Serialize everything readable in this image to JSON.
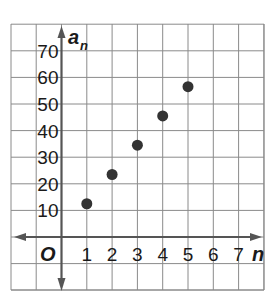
{
  "chart_data": {
    "type": "scatter",
    "title": "",
    "xlabel": "n",
    "ylabel": "a_n",
    "origin_label": "O",
    "x_ticks": [
      1,
      2,
      3,
      4,
      5,
      6,
      7
    ],
    "y_ticks": [
      10,
      20,
      30,
      40,
      50,
      60,
      70
    ],
    "xlim": [
      -2,
      8
    ],
    "ylim": [
      -2,
      8
    ],
    "y_unit_per_grid": 10,
    "grid": true,
    "legend": null,
    "points": [
      {
        "x": 1,
        "y": 12.5
      },
      {
        "x": 2,
        "y": 23.5
      },
      {
        "x": 3,
        "y": 34.5
      },
      {
        "x": 4,
        "y": 45.5
      },
      {
        "x": 5,
        "y": 56.5
      }
    ],
    "colors": {
      "grid": "#8a8a8a",
      "axis": "#555555",
      "point": "#333333",
      "text": "#1a1a1a"
    }
  }
}
